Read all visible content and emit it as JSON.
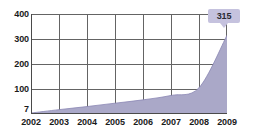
{
  "chart_data": {
    "type": "area",
    "title": "",
    "subtitle": "",
    "xlabel": "",
    "ylabel": "",
    "grid": true,
    "legend": null,
    "x": [
      2002,
      2003,
      2004,
      2005,
      2006,
      2007,
      2008,
      2009
    ],
    "categories": [
      "2002",
      "2003",
      "2004",
      "2005",
      "2006",
      "2007",
      "2008",
      "2009"
    ],
    "values": [
      7,
      20,
      32,
      45,
      58,
      75,
      105,
      315
    ],
    "series": [
      {
        "name": "value",
        "values": [
          7,
          20,
          32,
          45,
          58,
          75,
          105,
          315
        ]
      }
    ],
    "ylim": [
      0,
      400
    ],
    "xlim": [
      2002,
      2009
    ],
    "ytick_labels": [
      "400",
      "300",
      "200",
      "100",
      "7"
    ],
    "ytick_values": [
      400,
      300,
      200,
      100,
      7
    ],
    "xtick_labels": [
      "2002",
      "2003",
      "2004",
      "2005",
      "2006",
      "2007",
      "2008",
      "2009"
    ],
    "annotations": [
      {
        "name": "end-value-callout",
        "label": "315",
        "x": "2009",
        "y": 315
      }
    ],
    "colors": {
      "area_fill": "#aaa8c8",
      "area_line": "#8a87b4",
      "gridline": "#646464",
      "axis": "#4a4a4a",
      "callout_background": "#c5c2de",
      "callout_text": "#2a2a33",
      "tick_text": "#1a1a1a",
      "plot_background": "#ffffff"
    }
  },
  "axis": {
    "y": {
      "ticks": [
        {
          "label": "400",
          "top": 10
        },
        {
          "label": "300",
          "top": 35
        },
        {
          "label": "200",
          "top": 60
        },
        {
          "label": "100",
          "top": 85
        },
        {
          "label": "7",
          "top": 105
        }
      ]
    },
    "x": {
      "ticks": [
        {
          "label": "2002",
          "left": 0
        },
        {
          "label": "2003",
          "left": 28
        },
        {
          "label": "2004",
          "left": 56
        },
        {
          "label": "2005",
          "left": 84
        },
        {
          "label": "2006",
          "left": 112
        },
        {
          "label": "2007",
          "left": 140
        },
        {
          "label": "2008",
          "left": 168
        },
        {
          "label": "2009",
          "left": 196
        }
      ]
    }
  },
  "grid": {
    "horizontal": [
      0,
      25,
      50,
      75,
      99
    ],
    "vertical": [
      0,
      28,
      56,
      84,
      112,
      140,
      168,
      195
    ]
  },
  "callout": {
    "value": "315"
  }
}
